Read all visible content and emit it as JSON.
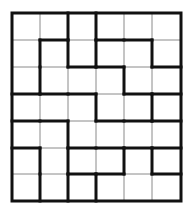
{
  "puzzle": {
    "type": "region-grid",
    "cols": 6,
    "rows": 7,
    "x_lines": [
      12,
      40,
      68,
      96,
      124,
      152,
      181
    ],
    "y_lines": [
      13,
      40,
      67,
      94,
      121,
      148,
      174,
      201
    ],
    "thin_color": "#8a8a8a",
    "thick_color": "#111111",
    "thin_width": 1,
    "thick_width": 3,
    "vertical_inner": [
      [
        0,
        1,
        1,
        0,
        0
      ],
      [
        1,
        1,
        1,
        0,
        1
      ],
      [
        1,
        0,
        0,
        1,
        0
      ],
      [
        0,
        0,
        1,
        0,
        1
      ],
      [
        0,
        1,
        0,
        0,
        0
      ],
      [
        1,
        1,
        0,
        1,
        1
      ],
      [
        1,
        1,
        1,
        0,
        0
      ]
    ],
    "horizontal_inner": [
      [
        0,
        1,
        0,
        1,
        1,
        0
      ],
      [
        0,
        0,
        1,
        1,
        0,
        1
      ],
      [
        1,
        1,
        1,
        0,
        1,
        1
      ],
      [
        1,
        1,
        0,
        1,
        1,
        1
      ],
      [
        1,
        0,
        1,
        1,
        1,
        1
      ],
      [
        0,
        0,
        1,
        1,
        0,
        1
      ]
    ]
  }
}
